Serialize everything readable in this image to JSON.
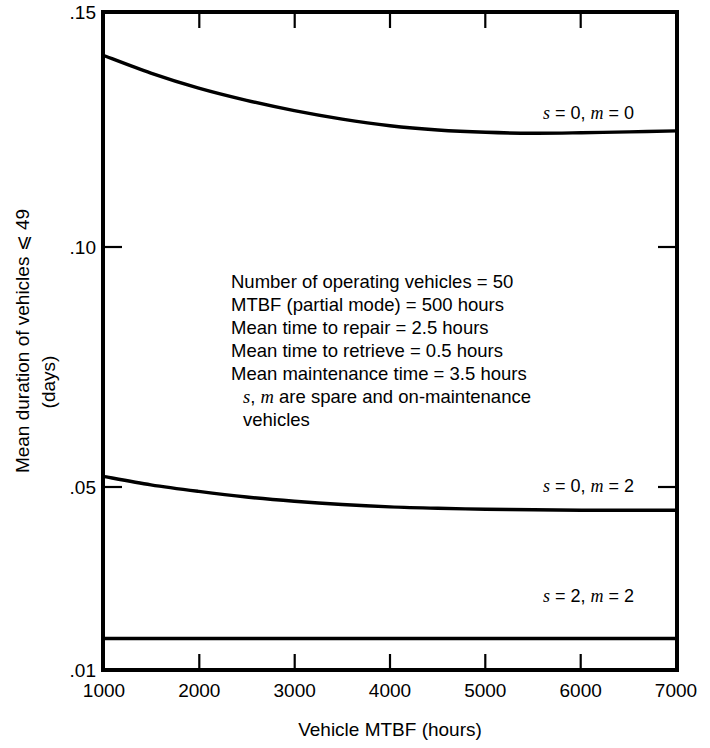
{
  "chart_data": {
    "type": "line",
    "title": "",
    "xlabel": "Vehicle MTBF (hours)",
    "ylabel_line1": "Mean duration of vehicles ⩽ 49",
    "ylabel_line2": "(days)",
    "xlim": [
      1000,
      7000
    ],
    "ylim": [
      0.01,
      0.15
    ],
    "grid": false,
    "xticks": [
      1000,
      2000,
      3000,
      4000,
      5000,
      6000,
      7000
    ],
    "xtick_labels": [
      "1000",
      "2000",
      "3000",
      "4000",
      "5000",
      "6000",
      "7000"
    ],
    "yticks": [
      0.15,
      0.1,
      0.05,
      0.01
    ],
    "ytick_labels": [
      ".15",
      ".10",
      ".05",
      ".01"
    ],
    "legend_position": "inline-on-curve",
    "series": [
      {
        "name": "s = 0, m = 0",
        "label_parts": {
          "s": "s",
          "eq1": " = 0, ",
          "m": "m",
          "eq2": " = 0"
        },
        "label_x": 4600,
        "label_y": 0.1325,
        "x": [
          1000,
          1500,
          2000,
          2500,
          3000,
          3500,
          4000,
          4500,
          5000,
          5500,
          6000,
          6500,
          7000
        ],
        "values": [
          0.1408,
          0.137,
          0.1338,
          0.1312,
          0.129,
          0.1272,
          0.1258,
          0.1249,
          0.1244,
          0.1242,
          0.1243,
          0.1245,
          0.1247
        ]
      },
      {
        "name": "s = 0, m = 2",
        "label_parts": {
          "s": "s",
          "eq1": " = 0, ",
          "m": "m",
          "eq2": " = 2"
        },
        "label_x": 4600,
        "label_y": 0.0472,
        "x": [
          1000,
          1500,
          2000,
          2500,
          3000,
          3500,
          4000,
          4500,
          5000,
          5500,
          6000,
          6500,
          7000
        ],
        "values": [
          0.0512,
          0.0494,
          0.048,
          0.0468,
          0.0459,
          0.0452,
          0.0447,
          0.0444,
          0.0442,
          0.0441,
          0.044,
          0.044,
          0.044
        ]
      },
      {
        "name": "s = 2, m = 2",
        "label_parts": {
          "s": "s",
          "eq1": " = 2, ",
          "m": "m",
          "eq2": " = 2"
        },
        "label_x": 4600,
        "label_y": 0.0205,
        "x": [
          1000,
          7000
        ],
        "values": [
          0.0167,
          0.0167
        ]
      }
    ],
    "annotation": {
      "lines": [
        "Number of operating vehicles = 50",
        "MTBF (partial mode) = 500 hours",
        "Mean time to repair = 2.5 hours",
        "Mean time to retrieve = 0.5 hours",
        "Mean maintenance time = 3.5 hours"
      ],
      "line6_parts": {
        "s": "s",
        "sep": ", ",
        "m": "m",
        "rest": " are spare and on-maintenance"
      },
      "line7": "vehicles"
    },
    "colors": {
      "line": "#000000",
      "axis": "#000000",
      "background": "#ffffff",
      "text": "#000000"
    }
  }
}
